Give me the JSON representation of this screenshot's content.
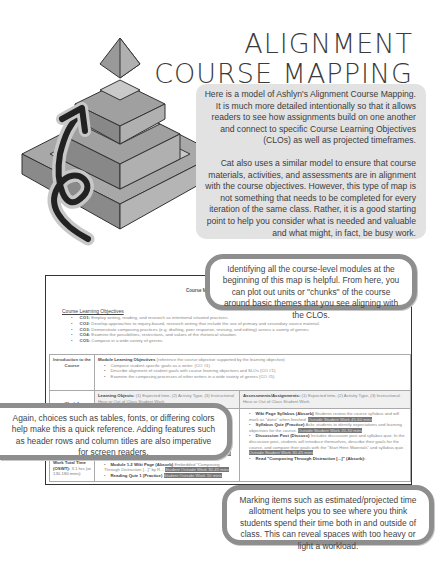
{
  "header": {
    "title_line1": "ALIGNMENT",
    "title_line2": "COURSE MAPPING"
  },
  "illustration": {
    "icon": "pyramid-with-upward-arrow-icon"
  },
  "intro": {
    "paragraph1": "Here is a model of Ashlyn's Alignment Course Mapping. It is much more detailed intentionally so that it allows readers to see how assignments build on one another and connect to specific Course Learning Objectives (CLOs) as well as projected timeframes.",
    "paragraph2": "Cat also uses a similar model to ensure that course materials, activities, and assessments are in alignment with the course objectives. However, this type of map is not something that needs to be completed for every iteration of the same class. Rather, it is a good starting point to help you consider what is needed and valuable and what might, in fact, be busy work."
  },
  "document": {
    "title": "Course Map",
    "clo_heading": "Course Learning Objectives",
    "clos": [
      {
        "code": "CO1:",
        "text": "Employ writing, reading, and research as intentional situated practices."
      },
      {
        "code": "CO2:",
        "text": "Develop approaches to inquiry-based, research writing that include the use of primary and secondary source material."
      },
      {
        "code": "CO3:",
        "text": "Demonstrate composing practices (e.g. drafting, peer response, revising, and editing) across a variety of genres."
      },
      {
        "code": "CO4:",
        "text": "Examine the possibilities, restrictions, and values of the rhetorical situation."
      },
      {
        "code": "CO5:",
        "text": "Compose in a wide variety of genres."
      }
    ],
    "table": {
      "intro_label": "Introduction to the Course",
      "module_objectives_title": "Module Learning Objectives",
      "module_objectives_note": "(reference the course objective supported by the learning objective)",
      "module_objectives": [
        "Compose student-specific goals as a writer. (CO #1)",
        "Describe alignment of student goals with course learning objectives and SLOs (CO #1)",
        "Examine the composing processes of other writers in a wide variety of genres (CO #5)"
      ],
      "week_label": "Week 1",
      "learning_objects_title": "Learning Objects:",
      "learning_objects_note": "(1) Expected time, (2) Activity Type, (3) Instructional Hour or Out of Class Student Work",
      "assessments_title": "Assessments/Assignments:",
      "assessments_note": "(1) Expected time, (2) Activity Type, (3) Instructional Hour or Out of Class Student Work",
      "oswt_label": "Outside Student Work Total Time (OSWT):",
      "oswt_value": "3.1 hrs (or 130-180 mins)",
      "learning_items": [
        {
          "bold": "",
          "text": "",
          "hl": "Outside Student Work 25-35 mins"
        },
        {
          "bold": "Module 1.1 Discussion Post (Discuss)",
          "text": "",
          "hl": "Outside Student Work 30-45 mins"
        },
        {
          "bold": "Module 1.2 Wiki Page (Absorb)",
          "text": "Embedded \"Composing Through Distraction [...]\" by R...",
          "hl": "Student Outside Work 30-45 mins"
        },
        {
          "bold": "Reading Quiz 1 (Practice)",
          "text": "",
          "hl": "Student Outside Work 10 mins"
        }
      ],
      "assessment_items": [
        {
          "bold": "Wiki Page Syllabus (Absorb)",
          "text": "Students review the course syllabus and will mark as \"done\" when finished.",
          "hl": "Outside Student Work 45-60 mins"
        },
        {
          "bold": "Syllabus Quiz (Practice)",
          "text": "Asks students to identify expectations and learning objectives for the course.",
          "hl": "Outside Student Work 20-30 mins"
        },
        {
          "bold": "Discussion Post (Discuss)",
          "text": "Includes discussion post and syllabus quiz. In the discussion post, students will introduce themselves, describe their goals for the course, and compare their goals with the \"Start Here Materials\" and syllabus quiz.",
          "hl": "Outside Student Work 30-45 mins"
        },
        {
          "bold": "Read \"Composing Through Distraction [...]\" (Absorb):",
          "text": "",
          "hl": ""
        }
      ]
    }
  },
  "callouts": {
    "top": "Identifying all the course-level modules at the beginning of this map is helpful. From here, you can plot out units or \"chunks\" of the course around basic themes that you see aligning with the CLOs.",
    "left": "Again, choices such as tables, fonts, or differing colors help make this a quick reference. Adding features such as header rows and column titles are also imperative for screen readers.",
    "bottom": "Marking items such as estimated/projected time allotment helps you to see where you think students spend their time both in and outside of class. This can reveal spaces with too heavy or light a workload."
  }
}
